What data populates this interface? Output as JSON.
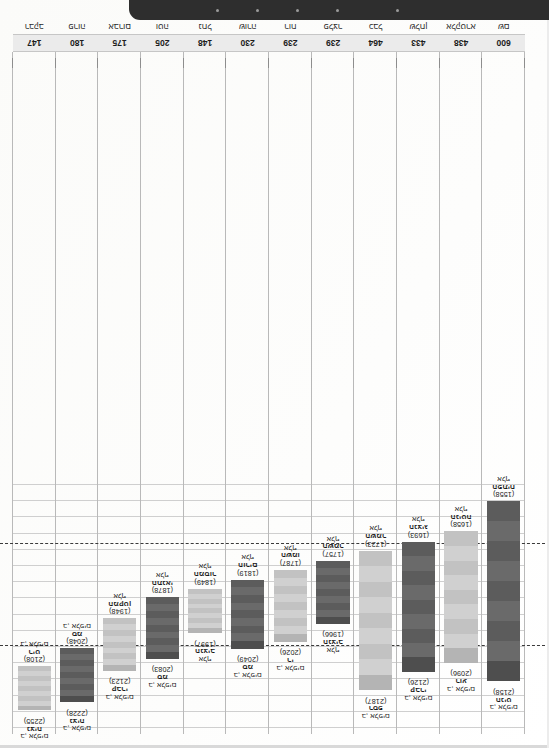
{
  "document": {
    "orientation": "rotated-180",
    "kind": "floating-range-bar-chart",
    "page_background": "#fefefe"
  },
  "chart_data": {
    "type": "bar",
    "subtype": "floating-range-bar",
    "title": "",
    "subtitle": "",
    "xlabel": "",
    "ylabel": "",
    "grid": true,
    "legend_position": "none",
    "ylim": [
      1500,
      2300
    ],
    "reference_lines": [
      {
        "value": 2040,
        "style": "dashed",
        "color": "#3a3a3a"
      },
      {
        "value": 1700,
        "style": "dashed",
        "color": "#3a3a3a"
      }
    ],
    "categories": [
      "שם",
      "אלקטרא",
      "שלחן",
      "כבל",
      "פלצר",
      "רוח",
      "שורה",
      "נחל",
      "וטה",
      "אברום",
      "פרוה",
      "רבקב"
    ],
    "category_counts": [
      600,
      438,
      433,
      464,
      239,
      239,
      230,
      148,
      205,
      175,
      180,
      147
    ],
    "bars": [
      {
        "index": 1,
        "high": 2158,
        "low": 1558,
        "high_label": [
          "ב, אלפים",
          "הניט",
          "(2158)"
        ],
        "low_label": [
          "אלף",
          "הפתיח",
          "(1558)"
        ],
        "shade": "dark"
      },
      {
        "index": 2,
        "high": 2096,
        "low": 1658,
        "high_label": [
          "ב, אלפים",
          "רוע",
          "(2096)"
        ],
        "low_label": [
          "אלף",
          "הניטה",
          "(1658)"
        ],
        "shade": "light"
      },
      {
        "index": 3,
        "high": 2126,
        "low": 1693,
        "high_label": [
          "ב, אלפים",
          "קברי",
          "(2126)"
        ],
        "low_label": [
          "אלף",
          "הנציג",
          "(1693)"
        ],
        "shade": "dark"
      },
      {
        "index": 4,
        "high": 2187,
        "low": 1723,
        "high_label": [
          "ב, אלפים",
          "רספ",
          "(2187)"
        ],
        "low_label": [
          "אלף",
          "השמר",
          "(1723)"
        ],
        "shade": "light"
      },
      {
        "index": 5,
        "high": 1966,
        "low": 1757,
        "high_label": [
          "אלף",
          "הנציב",
          "(1966)"
        ],
        "low_label": [
          "אלף",
          "השמר",
          "(1757)"
        ],
        "shade": "dark"
      },
      {
        "index": 6,
        "high": 2026,
        "low": 1787,
        "high_label": [
          "ב, אלפים",
          "רי",
          "(2026)"
        ],
        "low_label": [
          "אלף",
          "השמו",
          "(1787)"
        ],
        "shade": "light"
      },
      {
        "index": 7,
        "high": 2049,
        "low": 1819,
        "high_label": [
          "ב, אלפים",
          "סמ",
          "(2049)"
        ],
        "low_label": [
          "אלף",
          "הורים",
          "(1819)"
        ],
        "shade": "dark"
      },
      {
        "index": 8,
        "high": 1997,
        "low": 1849,
        "high_label": [
          "אלף",
          "הנציב",
          "(1997)"
        ],
        "low_label": [
          "אלף",
          "המסור",
          "(1849)"
        ],
        "shade": "light"
      },
      {
        "index": 9,
        "high": 2083,
        "low": 1878,
        "high_label": [
          "ב, אלפים",
          "סמ",
          "(2083)"
        ],
        "low_label": [
          "אלף",
          "התנאי",
          "(1878)"
        ],
        "shade": "dark"
      },
      {
        "index": 10,
        "high": 2123,
        "low": 1948,
        "high_label": [
          "ב, אלפים",
          "קברי",
          "(2123)"
        ],
        "low_label": [
          "אלף",
          "המקטן",
          "(1948)"
        ],
        "shade": "light"
      },
      {
        "index": 11,
        "high": 2228,
        "low": 2048,
        "high_label": [
          "ב, אלפים",
          "נציה",
          "(2228)"
        ],
        "low_label": [
          "ב, אלפים",
          "סמ",
          "(2048)"
        ],
        "shade": "dark"
      },
      {
        "index": 12,
        "high": 2255,
        "low": 2108,
        "high_label": [
          "ב, אלפים",
          "נציה",
          "(2255)"
        ],
        "low_label": [
          "ב, אלפים",
          "ריט",
          "(2108)"
        ],
        "shade": "light"
      }
    ]
  },
  "footer": {
    "caption": ""
  },
  "colors": {
    "bar_dark": "#5c5c5c",
    "bar_light": "#c2c2c2",
    "grid": "#cfcfcf",
    "refline": "#3a3a3a",
    "axis_band": "#ebebeb",
    "text": "#1a1a1a",
    "dark_strip": "#2e2e2e"
  }
}
